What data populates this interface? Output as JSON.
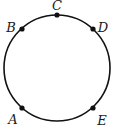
{
  "diagram": {
    "type": "circle-with-points",
    "circle": {
      "cx": 57,
      "cy": 68,
      "r": 53,
      "stroke": "#111111",
      "stroke_width": 1.6
    },
    "point_color": "#111111",
    "points": [
      {
        "label": "A",
        "x": 22,
        "y": 108,
        "lx": 13,
        "ly": 120
      },
      {
        "label": "B",
        "x": 22,
        "y": 29,
        "lx": 11,
        "ly": 28
      },
      {
        "label": "C",
        "x": 57,
        "y": 15,
        "lx": 57,
        "ly": 6
      },
      {
        "label": "D",
        "x": 93,
        "y": 29,
        "lx": 103,
        "ly": 28
      },
      {
        "label": "E",
        "x": 93,
        "y": 108,
        "lx": 102,
        "ly": 121
      }
    ]
  }
}
